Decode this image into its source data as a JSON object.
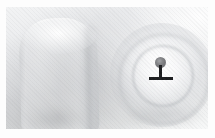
{
  "image": {
    "title": "Grayscale photo of two light objects with pin marker annotation",
    "width_px": "215",
    "height_px": "138",
    "palette": {
      "frame": "#fdfdfd",
      "backdrop_light": "#f2f3f4",
      "backdrop_mid": "#e3e4e6",
      "backdrop_shadow": "#9a9da1",
      "object_white": "#fcfcfc",
      "object_edge": "#bfc1c4",
      "marker_dark": "#1e1f21",
      "marker_head_gray": "#76777a"
    }
  },
  "scene": {
    "background_label": "soft gray gradient studio backdrop",
    "objects": [
      {
        "name": "cylinder",
        "label": "white rounded cylinder",
        "position": "left",
        "approx_box": "14,11 78x118"
      },
      {
        "name": "dome",
        "label": "white circular dome with concentric rings",
        "position": "right",
        "approx_box": "104,16 104x104"
      }
    ]
  },
  "annotation": {
    "marker": {
      "name": "pin-marker",
      "label": "T-shaped pin marker",
      "shape": "circular head on vertical stem above horizontal bar",
      "head_color": "#76777a",
      "stem_color": "#1e1f21",
      "bar_color": "#1e1f21",
      "center_x": "156",
      "center_y": "70",
      "target": "dome"
    }
  }
}
